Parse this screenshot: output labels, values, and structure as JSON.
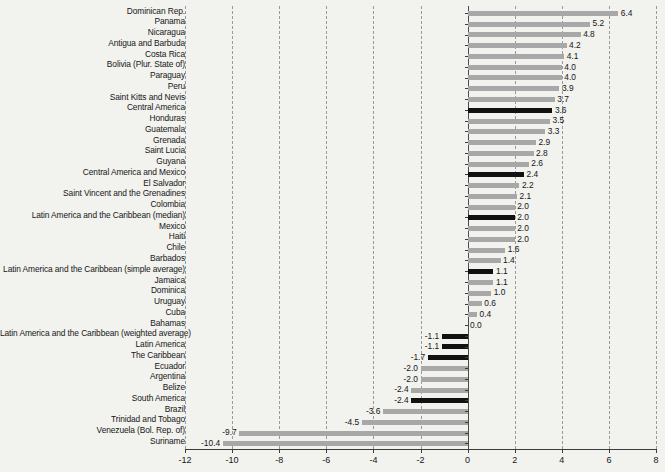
{
  "chart_data": {
    "type": "bar",
    "orientation": "horizontal",
    "title": "",
    "subtitle": "",
    "xlabel": "",
    "ylabel": "",
    "xlim": [
      -12,
      8
    ],
    "xticks": [
      -12,
      -10,
      -8,
      -6,
      -4,
      -2,
      0,
      2,
      4,
      6,
      8
    ],
    "xtick_labels": [
      "-12",
      "-10",
      "-8",
      "-6",
      "-4",
      "-2",
      "0",
      "2",
      "4",
      "6",
      "8"
    ],
    "grid": "vertical-dashed",
    "legend": "none",
    "colors": {
      "bar": "#a8a8a8",
      "highlight": "#111111",
      "background": "#f2f2ef",
      "gridline": "#9a9a9a",
      "axis": "#3c3c3c",
      "text": "#161616"
    },
    "categories": [
      "Dominican Rep.",
      "Panama",
      "Nicaragua",
      "Antigua and Barbuda",
      "Costa Rica",
      "Bolivia (Plur. State of)",
      "Paraguay",
      "Peru",
      "Saint Kitts and Nevis",
      "Central America",
      "Honduras",
      "Guatemala",
      "Grenada",
      "Saint Lucia",
      "Guyana",
      "Central America and Mexico",
      "El Salvador",
      "Saint Vincent and the Grenadines",
      "Colombia",
      "Latin America and the Caribbean (median)",
      "Mexico",
      "Haiti",
      "Chile",
      "Barbados",
      "Latin America and the Caribbean (simple average)",
      "Jamaica",
      "Dominica",
      "Uruguay",
      "Cuba",
      "Bahamas",
      "Latin America and the Caribbean (weighted average)",
      "Latin America",
      "The Caribbean",
      "Ecuador",
      "Argentina",
      "Belize",
      "South America",
      "Brazil",
      "Trinidad and Tobago",
      "Venezuela (Bol. Rep. of)",
      "Suriname"
    ],
    "values": [
      6.4,
      5.2,
      4.8,
      4.2,
      4.1,
      4.0,
      4.0,
      3.9,
      3.7,
      3.6,
      3.5,
      3.3,
      2.9,
      2.8,
      2.6,
      2.4,
      2.2,
      2.1,
      2.0,
      2.0,
      2.0,
      2.0,
      1.6,
      1.4,
      1.1,
      1.1,
      1.0,
      0.6,
      0.4,
      0.0,
      -1.1,
      -1.1,
      -1.7,
      -2.0,
      -2.0,
      -2.4,
      -2.4,
      -3.6,
      -4.5,
      -9.7,
      -10.4
    ],
    "value_labels": [
      "6.4",
      "5.2",
      "4.8",
      "4.2",
      "4.1",
      "4.0",
      "4.0",
      "3.9",
      "3.7",
      "3.6",
      "3.5",
      "3.3",
      "2.9",
      "2.8",
      "2.6",
      "2.4",
      "2.2",
      "2.1",
      "2.0",
      "2.0",
      "2.0",
      "2.0",
      "1.6",
      "1.4",
      "1.1",
      "1.1",
      "1.0",
      "0.6",
      "0.4",
      "0.0",
      "-1.1",
      "-1.1",
      "-1.7",
      "-2.0",
      "-2.0",
      "-2.4",
      "-2.4",
      "-3.6",
      "-4.5",
      "-9.7",
      "-10.4"
    ],
    "highlighted": [
      false,
      false,
      false,
      false,
      false,
      false,
      false,
      false,
      false,
      true,
      false,
      false,
      false,
      false,
      false,
      true,
      false,
      false,
      false,
      true,
      false,
      false,
      false,
      false,
      true,
      false,
      false,
      false,
      false,
      false,
      true,
      true,
      true,
      false,
      false,
      false,
      true,
      false,
      false,
      false,
      false
    ]
  }
}
